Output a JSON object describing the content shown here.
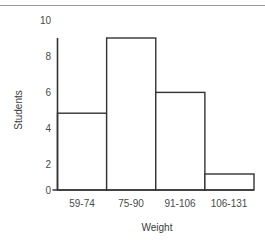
{
  "chart_data": {
    "type": "bar",
    "title": "",
    "subtitle": "",
    "xlabel": "Weight",
    "ylabel": "Students",
    "categories": [
      "59-74",
      "75-90",
      "91-106",
      "106-131"
    ],
    "values": [
      4.8,
      9.5,
      6.1,
      1
    ],
    "ylim": [
      0,
      10
    ],
    "yticks": [
      0,
      2,
      4,
      6,
      8,
      10
    ],
    "ytick_labels": [
      "0",
      "2",
      "4",
      "6",
      "8",
      "10"
    ],
    "grid": false,
    "legend": false,
    "legend_position": "none",
    "histogram": true,
    "annotations": []
  },
  "style": {
    "bar_fill": "#ffffff",
    "bar_stroke": "#333333",
    "axis_color": "#333333",
    "tick_label_color": "#4a4a4a",
    "axis_title_color": "#3a3a3a",
    "background": "#ffffff",
    "top_rule_color": "#9a9a9a"
  }
}
